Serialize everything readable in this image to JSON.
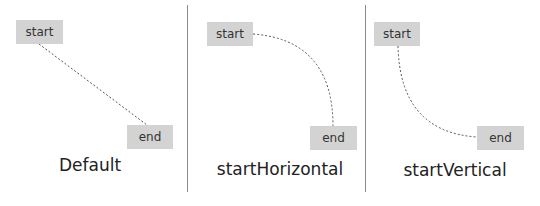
{
  "panels": [
    {
      "caption": "Default",
      "start": {
        "label": "start",
        "x": 16,
        "y": 20,
        "w": 47,
        "h": 24
      },
      "end": {
        "label": "end",
        "x": 127,
        "y": 125,
        "w": 46,
        "h": 24
      },
      "connector": {
        "type": "straight",
        "style": "dashed"
      }
    },
    {
      "caption": "startHorizontal",
      "start": {
        "label": "start",
        "x": 207,
        "y": 22,
        "w": 46,
        "h": 24
      },
      "end": {
        "label": "end",
        "x": 310,
        "y": 126,
        "w": 47,
        "h": 24
      },
      "connector": {
        "type": "curve-horizontal-start",
        "style": "dashed"
      }
    },
    {
      "caption": "startVertical",
      "start": {
        "label": "start",
        "x": 374,
        "y": 22,
        "w": 46,
        "h": 24
      },
      "end": {
        "label": "end",
        "x": 477,
        "y": 126,
        "w": 47,
        "h": 24
      },
      "connector": {
        "type": "curve-vertical-start",
        "style": "dashed"
      }
    }
  ],
  "colors": {
    "node_fill": "#d3d3d3",
    "line": "#555555",
    "divider": "#8a8a8a"
  }
}
